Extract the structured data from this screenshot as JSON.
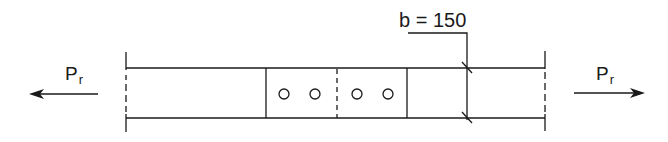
{
  "diagram": {
    "type": "bolted splice joint in tension (plan view)",
    "left_force": {
      "symbol": "P",
      "subscript": "r",
      "direction": "left"
    },
    "right_force": {
      "symbol": "P",
      "subscript": "r",
      "direction": "right"
    },
    "dimension": {
      "label": "b = 150"
    },
    "bolt_holes": {
      "count": 4,
      "per_side": 2
    },
    "colors": {
      "line": "#1a1a1a",
      "background": "#ffffff"
    }
  }
}
